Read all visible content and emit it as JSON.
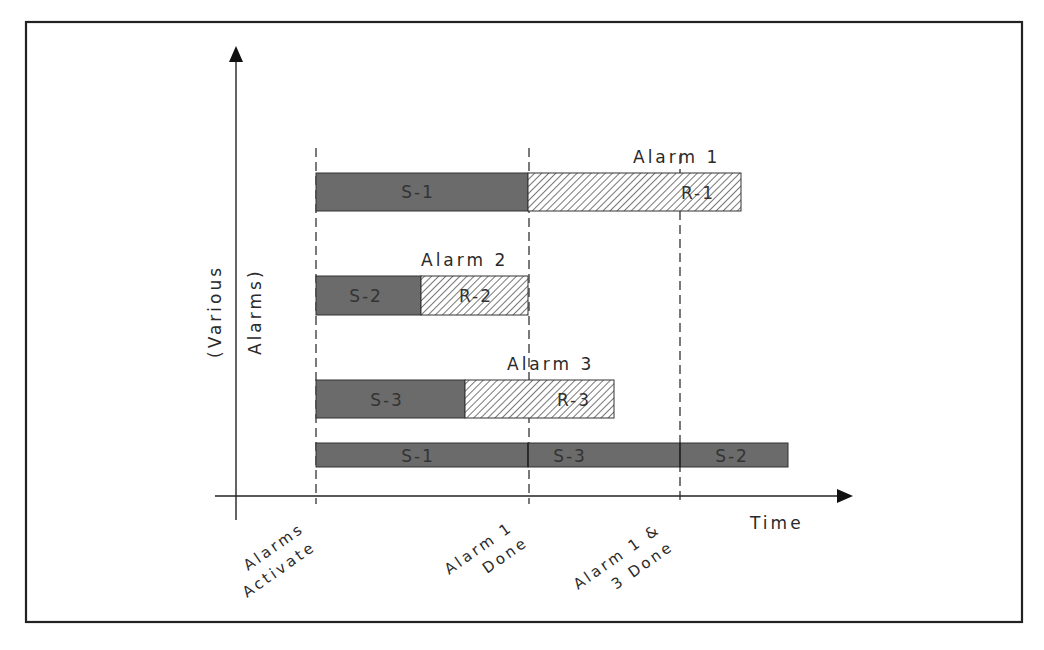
{
  "diagram": {
    "type": "timeline",
    "colors": {
      "frame": "#222222",
      "service_fill": "#6b6b6b",
      "response_hatch": "#555555",
      "axis": "#222222"
    },
    "axes": {
      "y_label_line1": "(Various",
      "y_label_line2": "Alarms)",
      "x_label": "Time"
    },
    "milestones": [
      {
        "line1": "Alarms",
        "line2": "Activate"
      },
      {
        "line1": "Alarm 1",
        "line2": "Done"
      },
      {
        "line1": "Alarm 1 &",
        "line2": "3 Done"
      }
    ],
    "alarms": [
      {
        "title": "Alarm 1",
        "service": "S-1",
        "response": "R-1"
      },
      {
        "title": "Alarm 2",
        "service": "S-2",
        "response": "R-2"
      },
      {
        "title": "Alarm 3",
        "service": "S-3",
        "response": "R-3"
      }
    ],
    "combined_sequence": [
      "S-1",
      "S-3",
      "S-2"
    ]
  }
}
